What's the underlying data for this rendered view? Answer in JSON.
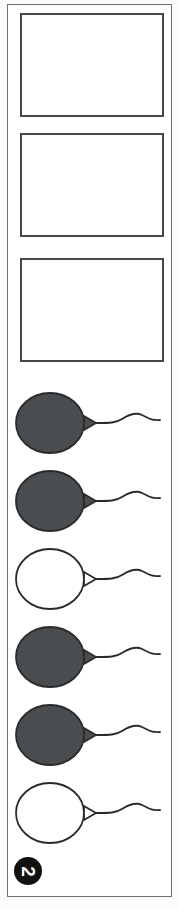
{
  "page": {
    "number_label": "2",
    "orientation_note": "sideways",
    "width": 178,
    "height": 910
  },
  "colors": {
    "balloon_dark_fill": "#4a4d50",
    "outline": "#2b2b2b",
    "box_border": "#45484c",
    "page_border": "#6f6f6f",
    "badge_background": "#111111",
    "badge_text": "#ffffff",
    "paper": "#ffffff"
  },
  "answer_boxes": [
    {
      "index": 1,
      "label": "",
      "value": ""
    },
    {
      "index": 2,
      "label": "",
      "value": ""
    },
    {
      "index": 3,
      "label": "",
      "value": ""
    }
  ],
  "balloons": [
    {
      "index": 1,
      "fill": "dark",
      "icon": "balloon-icon"
    },
    {
      "index": 2,
      "fill": "dark",
      "icon": "balloon-icon"
    },
    {
      "index": 3,
      "fill": "white",
      "icon": "balloon-icon"
    },
    {
      "index": 4,
      "fill": "dark",
      "icon": "balloon-icon"
    },
    {
      "index": 5,
      "fill": "dark",
      "icon": "balloon-icon"
    },
    {
      "index": 6,
      "fill": "white",
      "icon": "balloon-icon"
    }
  ]
}
